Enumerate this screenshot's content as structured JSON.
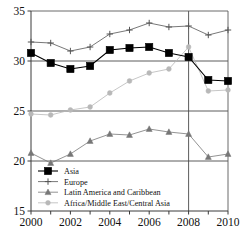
{
  "chart_data": {
    "type": "line",
    "title": "",
    "xlabel": "",
    "ylabel": "",
    "x": [
      2000,
      2001,
      2002,
      2003,
      2004,
      2005,
      2006,
      2007,
      2008,
      2009,
      2010
    ],
    "xlim": [
      2000,
      2010
    ],
    "ylim": [
      15,
      35
    ],
    "xticks": [
      2000,
      2001,
      2002,
      2003,
      2004,
      2005,
      2006,
      2007,
      2008,
      2009,
      2010
    ],
    "xtick_labels": [
      "2000",
      "",
      "2002",
      "",
      "2004",
      "",
      "2006",
      "",
      "2008",
      "",
      "2010"
    ],
    "yticks": [
      15,
      20,
      25,
      30,
      35
    ],
    "ytick_labels": [
      "15",
      "20",
      "25",
      "30",
      "35"
    ],
    "grid": "horizontal gridlines at 20, 25, 30 and vertical reference line at 2008",
    "reference_line_x": 2008,
    "legend_position": "lower-left inside axes",
    "series": [
      {
        "name": "Asia",
        "marker": "filled-square",
        "color": "#000000",
        "values": [
          30.8,
          29.8,
          29.2,
          29.5,
          31.1,
          31.3,
          31.4,
          30.8,
          30.4,
          28.1,
          28.0
        ]
      },
      {
        "name": "Europe",
        "marker": "plus",
        "color": "#555555",
        "values": [
          31.9,
          31.8,
          31.0,
          31.4,
          32.7,
          33.1,
          33.8,
          33.4,
          33.5,
          32.6,
          33.1
        ]
      },
      {
        "name": "Latin America and Caribbean",
        "marker": "filled-triangle",
        "color": "#777777",
        "values": [
          20.8,
          19.8,
          20.7,
          22.0,
          22.7,
          22.6,
          23.2,
          22.9,
          22.7,
          20.4,
          20.7
        ]
      },
      {
        "name": "Africa/Middle East/Central Asia",
        "marker": "filled-circle",
        "color": "#b8b8b8",
        "values": [
          24.7,
          24.6,
          25.1,
          25.4,
          26.8,
          28.0,
          28.8,
          29.2,
          31.4,
          27.0,
          27.1
        ]
      }
    ]
  },
  "axes": {
    "y_tick_labels": [
      "35",
      "30",
      "25",
      "20",
      "15"
    ],
    "x_tick_labels": [
      "2000",
      "2002",
      "2004",
      "2006",
      "2008",
      "2010"
    ]
  },
  "legend": {
    "items": [
      {
        "label": "Asia",
        "marker": "filled-square"
      },
      {
        "label": "Europe",
        "marker": "plus"
      },
      {
        "label": "Latin America and Caribbean",
        "marker": "filled-triangle"
      },
      {
        "label": "Africa/Middle East/Central Asia",
        "marker": "filled-circle"
      }
    ]
  }
}
